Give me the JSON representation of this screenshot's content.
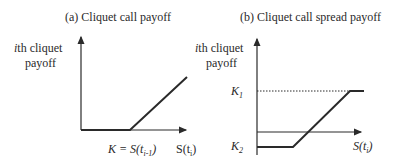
{
  "panel_a": {
    "title": "(a) Cliquet call payoff",
    "y_label_line1_italic": "i",
    "y_label_line1_rest": "th cliquet",
    "y_label_line2": "payoff",
    "strike_label": "K = S(t",
    "strike_sub": "i-1",
    "strike_close": ")",
    "x_label": "S(t",
    "x_sub": "i",
    "x_close": ")"
  },
  "panel_b": {
    "title": "(b) Cliquet call spread payoff",
    "y_label_line1_italic": "i",
    "y_label_line1_rest": "th cliquet",
    "y_label_line2": "payoff",
    "k1_label": "K",
    "k1_sub": "1",
    "k2_label": "K",
    "k2_sub": "2",
    "x_label": "S(t",
    "x_sub": "i",
    "x_close": ")"
  },
  "colors": {
    "line": "#2a2a2a",
    "background": "#ffffff"
  }
}
